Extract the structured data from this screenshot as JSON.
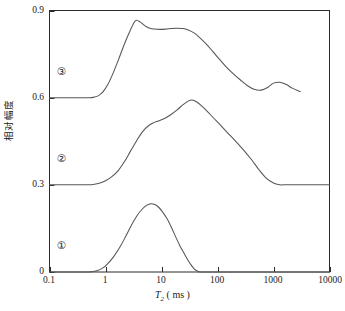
{
  "chart_data": {
    "type": "line",
    "title": "",
    "xlabel": "T2 ( ms )",
    "xlabel_var": "T",
    "xlabel_sub": "2",
    "xlabel_unit": "( ms )",
    "ylabel": "相对幅度",
    "xscale": "log",
    "xlim": [
      0.1,
      10000
    ],
    "ylim": [
      0,
      0.9
    ],
    "grid": false,
    "legend": "none",
    "xticks": [
      "0.1",
      "1",
      "10",
      "100",
      "1000",
      "10000"
    ],
    "xtick_values": [
      0.1,
      1,
      10,
      100,
      1000,
      10000
    ],
    "yticks": [
      "0",
      "0.3",
      "0.6",
      "0.9"
    ],
    "ytick_values": [
      0,
      0.3,
      0.6,
      0.9
    ],
    "annotations": [
      {
        "label": "①",
        "x": 0.17,
        "y": 0.045
      },
      {
        "label": "②",
        "x": 0.17,
        "y": 0.345
      },
      {
        "label": "③",
        "x": 0.17,
        "y": 0.645
      }
    ],
    "series": [
      {
        "name": "①",
        "baseline": 0,
        "peak_x": 6.5,
        "peak_y": 0.235,
        "x": [
          0.1,
          0.3,
          0.5,
          0.7,
          0.9,
          1.1,
          1.4,
          1.8,
          2.3,
          2.9,
          3.6,
          4.5,
          5.5,
          6.5,
          7.6,
          9.0,
          10.5,
          12.5,
          15.0,
          18.0,
          21.5,
          25.0,
          29.0,
          33.0,
          38.0,
          43.0,
          50.0,
          100,
          1000,
          10000
        ],
        "values": [
          0,
          0,
          0,
          0.004,
          0.014,
          0.029,
          0.053,
          0.085,
          0.123,
          0.161,
          0.192,
          0.216,
          0.23,
          0.235,
          0.232,
          0.222,
          0.206,
          0.184,
          0.154,
          0.12,
          0.089,
          0.066,
          0.044,
          0.027,
          0.012,
          0.004,
          0,
          0,
          0,
          0
        ]
      },
      {
        "name": "②",
        "baseline": 0.3,
        "peak_x": 35,
        "peak_y": 0.592,
        "x": [
          0.1,
          0.3,
          0.5,
          0.6,
          0.8,
          1.0,
          1.3,
          1.7,
          2.2,
          2.8,
          3.6,
          4.6,
          6.0,
          7.5,
          9.5,
          12,
          15,
          19,
          24,
          30,
          35,
          42,
          52,
          65,
          85,
          110,
          150,
          200,
          280,
          400,
          550,
          750,
          1000,
          1300,
          1500,
          2000,
          4000,
          10000
        ],
        "values": [
          0.3,
          0.3,
          0.3,
          0.301,
          0.306,
          0.314,
          0.328,
          0.35,
          0.381,
          0.416,
          0.452,
          0.483,
          0.505,
          0.515,
          0.522,
          0.531,
          0.543,
          0.558,
          0.575,
          0.588,
          0.592,
          0.586,
          0.572,
          0.554,
          0.53,
          0.508,
          0.48,
          0.455,
          0.424,
          0.388,
          0.352,
          0.322,
          0.306,
          0.3,
          0.3,
          0.3,
          0.3,
          0.3
        ]
      },
      {
        "name": "③",
        "baseline": 0.6,
        "peak_x": 3.5,
        "peak_y": 0.866,
        "x": [
          0.1,
          0.3,
          0.5,
          0.6,
          0.75,
          0.9,
          1.1,
          1.35,
          1.7,
          2.1,
          2.6,
          3.1,
          3.5,
          4.2,
          5.0,
          6.0,
          7.5,
          9.5,
          12,
          15,
          19,
          24,
          30,
          38,
          48,
          62,
          80,
          105,
          140,
          190,
          260,
          350,
          450,
          600,
          800,
          1000,
          1300,
          1700,
          2200,
          3000
        ],
        "values": [
          0.6,
          0.6,
          0.6,
          0.601,
          0.607,
          0.62,
          0.645,
          0.682,
          0.73,
          0.777,
          0.82,
          0.852,
          0.866,
          0.86,
          0.848,
          0.84,
          0.836,
          0.835,
          0.836,
          0.838,
          0.839,
          0.838,
          0.833,
          0.823,
          0.807,
          0.786,
          0.762,
          0.735,
          0.708,
          0.683,
          0.66,
          0.64,
          0.629,
          0.626,
          0.636,
          0.65,
          0.653,
          0.645,
          0.632,
          0.621
        ]
      }
    ]
  }
}
